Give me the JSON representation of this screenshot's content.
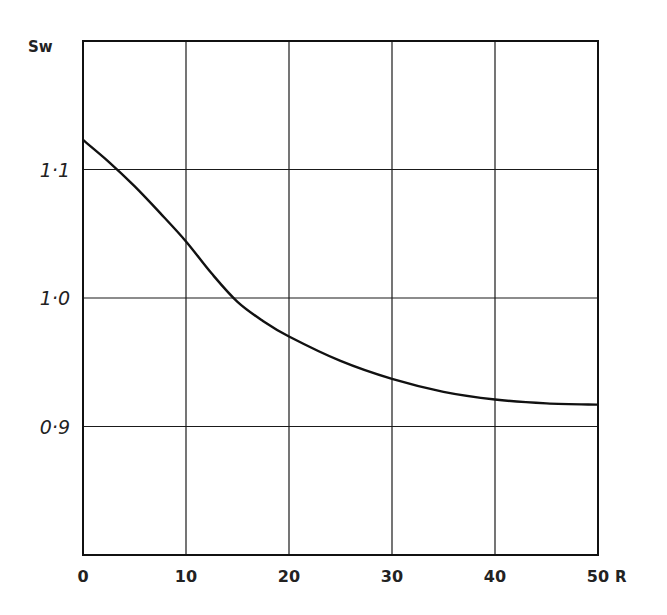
{
  "chart_data": {
    "type": "line",
    "title": "",
    "xlabel": "R",
    "ylabel": "Sw",
    "xlim": [
      0,
      50
    ],
    "ylim": [
      0.8,
      1.2
    ],
    "x_ticks": [
      0,
      10,
      20,
      30,
      40,
      50
    ],
    "x_tick_labels": [
      "0",
      "10",
      "20",
      "30",
      "40",
      "50"
    ],
    "y_ticks": [
      0.9,
      1.0,
      1.1
    ],
    "y_tick_labels": [
      "0·9",
      "1·0",
      "1·1"
    ],
    "grid": true,
    "legend": null,
    "series": [
      {
        "name": "Sw",
        "x": [
          0,
          2.5,
          5,
          7.5,
          10,
          12.5,
          15,
          17.5,
          20,
          25,
          30,
          35,
          40,
          45,
          50
        ],
        "values": [
          1.123,
          1.106,
          1.087,
          1.066,
          1.044,
          1.019,
          0.997,
          0.982,
          0.97,
          0.951,
          0.937,
          0.927,
          0.921,
          0.918,
          0.917
        ]
      }
    ]
  }
}
